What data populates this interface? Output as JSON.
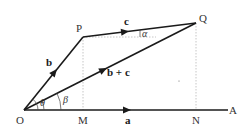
{
  "diagram": {
    "points": {
      "O": "O",
      "P": "P",
      "Q": "Q",
      "M": "M",
      "N": "N",
      "A": "A"
    },
    "vectors": {
      "a": "a",
      "b": "b",
      "c": "c",
      "b_plus_c": "b + c"
    },
    "angles": {
      "theta": "θ",
      "beta": "β",
      "alpha": "α"
    },
    "edges": [
      {
        "from": "O",
        "to": "A",
        "label": "a",
        "style": "solid",
        "arrow": "mid"
      },
      {
        "from": "O",
        "to": "P",
        "label": "b",
        "style": "solid",
        "arrow": "mid"
      },
      {
        "from": "P",
        "to": "Q",
        "label": "c",
        "style": "solid",
        "arrow": "mid"
      },
      {
        "from": "O",
        "to": "Q",
        "label": "b + c",
        "style": "solid",
        "arrow": "mid"
      },
      {
        "from": "P",
        "to": "M",
        "style": "dashed"
      },
      {
        "from": "Q",
        "to": "N",
        "style": "dashed"
      },
      {
        "from": "P",
        "to": "Q-horizontal",
        "style": "dashed"
      }
    ],
    "colors": {
      "line": "#1a1a1a",
      "dashed": "#b8b8b8",
      "text": "#333333",
      "background": "#ffffff"
    }
  }
}
